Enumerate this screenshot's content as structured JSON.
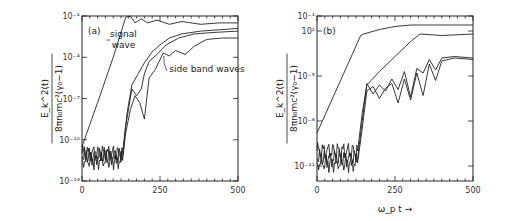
{
  "chart_data": [
    {
      "type": "line",
      "panel_label": "(a)",
      "title": "",
      "xlabel": "",
      "ylabel_numerator": "E_k^2(t)",
      "ylabel_denominator": "8πn₀mc²(γ₀−1)",
      "xlim": [
        0,
        500
      ],
      "ylim_log10": [
        -13,
        -1
      ],
      "xticks": [
        "0",
        "250",
        "500"
      ],
      "yticks": [
        {
          "exp": -1,
          "label": "10⁻¹"
        },
        {
          "exp": -4,
          "label": "10⁻⁴"
        },
        {
          "exp": -7,
          "label": "10⁻⁷"
        },
        {
          "exp": -10,
          "label": "10⁻¹⁰"
        },
        {
          "exp": -13,
          "label": "10⁻¹³"
        }
      ],
      "annotations": [
        {
          "text": "signal",
          "text2": "wave",
          "target": "signal wave"
        },
        {
          "text": "side band waves",
          "target": "side band waves"
        }
      ],
      "series": [
        {
          "name": "signal wave",
          "x": [
            0,
            50,
            100,
            140,
            155,
            170,
            190,
            210,
            240,
            280,
            320,
            380,
            440,
            500
          ],
          "log10y": [
            -10.5,
            -7.3,
            -4,
            -1.1,
            -1.0,
            -1.5,
            -1.2,
            -1.5,
            -1.3,
            -1.6,
            -1.4,
            -1.6,
            -1.5,
            -1.5
          ]
        },
        {
          "name": "side band 1",
          "x": [
            0,
            130,
            145,
            160,
            180,
            200,
            225,
            250,
            280,
            320,
            380,
            440,
            500
          ],
          "log10y": [
            -11,
            -11,
            -8,
            -6,
            -5.2,
            -4.4,
            -3.6,
            -3.1,
            -2.6,
            -2.3,
            -2.1,
            -2.0,
            -1.9
          ]
        },
        {
          "name": "side band 2",
          "x": [
            0,
            130,
            140,
            160,
            175,
            190,
            200,
            215,
            240,
            270,
            310,
            360,
            420,
            500
          ],
          "log10y": [
            -11.2,
            -11.2,
            -9,
            -6.3,
            -6.8,
            -6.3,
            -5.2,
            -4.3,
            -3.8,
            -3.1,
            -2.6,
            -2.3,
            -2.2,
            -2.1
          ]
        },
        {
          "name": "side band 3",
          "x": [
            0,
            130,
            140,
            155,
            170,
            185,
            200,
            215,
            235,
            260,
            280,
            300,
            330,
            360,
            400,
            450,
            500
          ],
          "log10y": [
            -11.5,
            -11.5,
            -9.5,
            -7.8,
            -6.8,
            -7.3,
            -8.5,
            -5.5,
            -4.9,
            -3.7,
            -3.9,
            -3.5,
            -3.8,
            -3.2,
            -2.7,
            -2.6,
            -2.6
          ]
        }
      ]
    },
    {
      "type": "line",
      "panel_label": "(b)",
      "title": "",
      "xlabel": "ω_p t →",
      "ylabel_numerator": "E_k^2(t)",
      "ylabel_denominator": "8πn₀mc²(γ₀−1)",
      "xlim": [
        0,
        500
      ],
      "ylim_log10": [
        -12,
        -1
      ],
      "xticks": [
        "0",
        "250",
        "500"
      ],
      "yticks": [
        {
          "exp": -1,
          "label": "10⁻¹"
        },
        {
          "exp": -2,
          "label": "10²"
        },
        {
          "exp": -5,
          "label": "10⁻⁵"
        },
        {
          "exp": -8,
          "label": "10⁻⁸"
        },
        {
          "exp": -11,
          "label": "10⁻¹¹"
        }
      ],
      "series": [
        {
          "name": "signal wave",
          "x": [
            0,
            140,
            150,
            200,
            250,
            300,
            400,
            500
          ],
          "log10y": [
            -8.8,
            -2.3,
            -2.2,
            -1.9,
            -1.7,
            -1.6,
            -1.6,
            -1.6
          ]
        },
        {
          "name": "side band 1",
          "x": [
            0,
            130,
            145,
            160,
            200,
            250,
            300,
            330,
            400,
            500
          ],
          "log10y": [
            -10,
            -10,
            -7.5,
            -5.6,
            -4.7,
            -3.7,
            -2.7,
            -2.2,
            -2.3,
            -2.2
          ]
        },
        {
          "name": "side band 2",
          "x": [
            0,
            130,
            145,
            160,
            180,
            200,
            220,
            240,
            260,
            280,
            300,
            320,
            340,
            360,
            380,
            400,
            440,
            500
          ],
          "log10y": [
            -10.5,
            -10.5,
            -8,
            -5.5,
            -6.2,
            -5.6,
            -6,
            -5.2,
            -5.9,
            -4.7,
            -6.4,
            -4.5,
            -4.8,
            -3.9,
            -4.6,
            -3.8,
            -3.7,
            -3.8
          ]
        },
        {
          "name": "side band 3",
          "x": [
            0,
            130,
            145,
            160,
            180,
            200,
            220,
            240,
            260,
            280,
            300,
            320,
            340,
            360,
            380,
            400,
            440,
            500
          ],
          "log10y": [
            -10.8,
            -10.8,
            -8.5,
            -6,
            -5.7,
            -6.5,
            -5.8,
            -5.5,
            -6.8,
            -5.2,
            -6.6,
            -4.8,
            -6.3,
            -4.2,
            -5.3,
            -4,
            -3.8,
            -3.9
          ]
        }
      ]
    }
  ]
}
